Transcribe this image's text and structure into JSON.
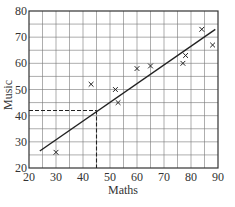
{
  "chart_data": {
    "type": "scatter",
    "title": "",
    "xlabel": "Maths",
    "ylabel": "Music",
    "xlim": [
      20,
      90
    ],
    "ylim": [
      20,
      80
    ],
    "x_ticks": [
      20,
      30,
      40,
      50,
      60,
      70,
      80,
      90
    ],
    "y_ticks": [
      20,
      30,
      40,
      50,
      60,
      70,
      80
    ],
    "grid": true,
    "grid_step": 5,
    "marker": "x",
    "series": [
      {
        "name": "students",
        "points": [
          {
            "x": 30,
            "y": 26
          },
          {
            "x": 43,
            "y": 52
          },
          {
            "x": 52,
            "y": 50
          },
          {
            "x": 53,
            "y": 45
          },
          {
            "x": 60,
            "y": 58
          },
          {
            "x": 65,
            "y": 59
          },
          {
            "x": 77,
            "y": 60
          },
          {
            "x": 78,
            "y": 63
          },
          {
            "x": 84,
            "y": 73
          },
          {
            "x": 88,
            "y": 67
          }
        ]
      }
    ],
    "line_of_best_fit": {
      "x1": 24,
      "y1": 26.5,
      "x2": 89,
      "y2": 73
    },
    "annotations": [
      {
        "type": "dashed-reading",
        "x": 45,
        "y": 42
      }
    ],
    "legend": null
  },
  "colors": {
    "grid": "#777777",
    "ink": "#222222"
  }
}
